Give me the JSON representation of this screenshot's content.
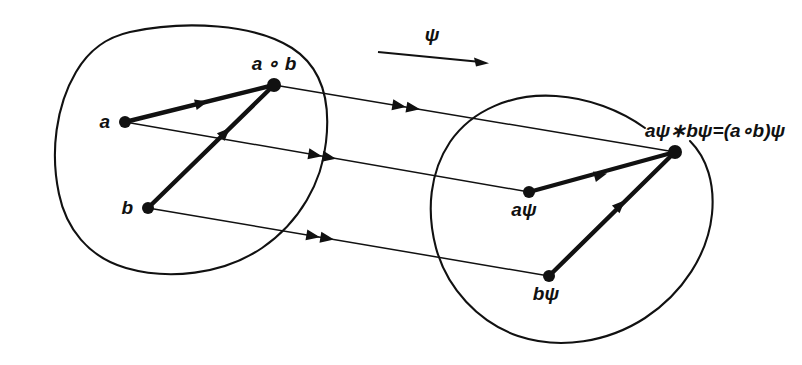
{
  "figure": {
    "type": "commutative-diagram",
    "background_color": "#ffffff",
    "ink_color": "#111111"
  },
  "map_arrow": {
    "label": "ψ",
    "name": "psi",
    "direction": "left-to-right",
    "x1": 378,
    "y1": 52,
    "x2": 489,
    "y2": 63,
    "label_x": 432,
    "label_y": 40
  },
  "domain_blob": {
    "name": "source-set",
    "nodes": [
      {
        "id": "a",
        "label": "a",
        "x": 125,
        "y": 122,
        "label_x": 110,
        "label_y": 128,
        "anchor": "end"
      },
      {
        "id": "b",
        "label": "b",
        "x": 148,
        "y": 208,
        "label_x": 133,
        "label_y": 214,
        "anchor": "end"
      },
      {
        "id": "a_op_b",
        "label": "a ∘ b",
        "x": 274,
        "y": 85,
        "label_x": 274,
        "label_y": 70,
        "anchor": "middle"
      }
    ],
    "edges": [
      {
        "from": "a",
        "to": "a_op_b",
        "style": "bold-arrow"
      },
      {
        "from": "b",
        "to": "a_op_b",
        "style": "bold-arrow"
      }
    ]
  },
  "codomain_blob": {
    "name": "target-set",
    "nodes": [
      {
        "id": "a_psi",
        "label": "aψ",
        "x": 529,
        "y": 192,
        "label_x": 524,
        "label_y": 216,
        "anchor": "middle"
      },
      {
        "id": "b_psi",
        "label": "bψ",
        "x": 549,
        "y": 276,
        "label_x": 546,
        "label_y": 300,
        "anchor": "middle"
      },
      {
        "id": "prod",
        "label": "aψ∗bψ=(a∘b)ψ",
        "x": 675,
        "y": 152,
        "label_x": 645,
        "label_y": 137,
        "anchor": "start"
      }
    ],
    "edges": [
      {
        "from": "a_psi",
        "to": "prod",
        "style": "bold-arrow"
      },
      {
        "from": "b_psi",
        "to": "prod",
        "style": "bold-arrow"
      }
    ]
  },
  "mapping_lines": [
    {
      "name": "map-a-op-b",
      "from": "a_op_b",
      "to": "prod",
      "x1": 274,
      "y1": 85,
      "x2": 675,
      "y2": 152,
      "arrow": "double"
    },
    {
      "name": "map-a",
      "from": "a",
      "to": "a_psi",
      "x1": 125,
      "y1": 122,
      "x2": 529,
      "y2": 192,
      "arrow": "double"
    },
    {
      "name": "map-b",
      "from": "b",
      "to": "b_psi",
      "x1": 148,
      "y1": 208,
      "x2": 549,
      "y2": 276,
      "arrow": "double"
    }
  ]
}
